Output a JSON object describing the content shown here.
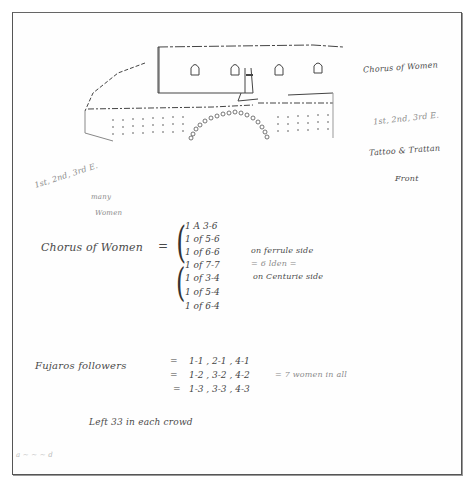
{
  "sketch_notes": {
    "label_right_top": "Chorus of Women",
    "label_right_mid": "1st, 2nd, 3rd E.",
    "label_right_lower": "Tattoo & Trattan",
    "label_right_bottom": "Front",
    "label_left_slanted": "1st, 2nd, 3rd E.",
    "label_left_many": "many",
    "label_left_women": "Women"
  },
  "chorus": {
    "heading": "Chorus of Women",
    "equals": "=",
    "rows": [
      {
        "text": "1  A  3-6",
        "note": ""
      },
      {
        "text": "1  of  5-6",
        "note": ""
      },
      {
        "text": "1  of  6-6",
        "note": "on ferrule side"
      },
      {
        "text": "1  of  7-7",
        "note": "= 6 lden ="
      },
      {
        "text": "1  of  3-4",
        "note": "on Centurie side"
      },
      {
        "text": "1  of  5-4",
        "note": ""
      },
      {
        "text": "1  of  6-4",
        "note": ""
      }
    ]
  },
  "followers": {
    "heading": "Fujaros followers",
    "lines": [
      {
        "eq": "=",
        "text": "1-1 ,  2-1 ,  4-1",
        "note": ""
      },
      {
        "eq": "=",
        "text": "1-2 ,  3-2 ,  4-2",
        "note": "= 7 women in all"
      },
      {
        "eq": "=",
        "text": "1-3 ,  3-3 ,  4-3",
        "note": ""
      }
    ]
  },
  "footer": {
    "line": "Left 33 in each crowd",
    "faint_mark": "a ~ ~ ~ d"
  }
}
